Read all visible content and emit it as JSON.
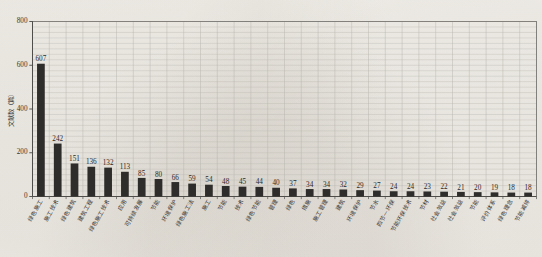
{
  "chart_data": {
    "type": "bar",
    "title": "",
    "xlabel": "",
    "ylabel": "文献数（篇）",
    "ylim": [
      0,
      800
    ],
    "yticks": [
      0,
      200,
      400,
      600,
      800
    ],
    "grid": true,
    "legend": null,
    "categories": [
      "绿色施工",
      "施工技术",
      "绿色建筑",
      "建筑工程",
      "绿色施工技术",
      "应用",
      "可持续发展",
      "节能",
      "环境保护",
      "绿色施工法",
      "施工",
      "节能",
      "技术",
      "绿色节能",
      "管理",
      "绿色",
      "措施",
      "施工管理",
      "建筑",
      "环境保护",
      "节水",
      "四节一环保",
      "节能环保技术",
      "节材",
      "社会效益",
      "社会效益",
      "节能",
      "评价体系",
      "绿色理念",
      "节能减排"
    ],
    "values": [
      607,
      242,
      151,
      136,
      132,
      113,
      85,
      80,
      66,
      59,
      54,
      48,
      45,
      44,
      40,
      37,
      34,
      34,
      32,
      29,
      27,
      24,
      24,
      23,
      22,
      21,
      20,
      19,
      18,
      18
    ]
  },
  "colors": {
    "bar": "#2f2d2b",
    "grid": "#bdbab4",
    "axis": "#4a4845",
    "paper": "#f4f2ee"
  }
}
